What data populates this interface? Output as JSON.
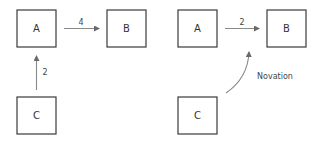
{
  "diagrams": [
    {
      "name": "left",
      "nodes": {
        "a": "A",
        "b": "B",
        "c": "C"
      },
      "edges": [
        {
          "from": "A",
          "to": "B",
          "label": "4"
        },
        {
          "from": "C",
          "to": "A",
          "label": "2"
        }
      ]
    },
    {
      "name": "right",
      "nodes": {
        "a": "A",
        "b": "B",
        "c": "C"
      },
      "edges": [
        {
          "from": "A",
          "to": "B",
          "label": "2"
        },
        {
          "from": "C",
          "to": "A-B edge",
          "label": "Novation"
        }
      ]
    }
  ],
  "colors": {
    "box_stroke": "#3a3a3a",
    "arrow": "#8a8a8a"
  }
}
